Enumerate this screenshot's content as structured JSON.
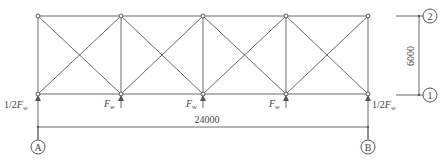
{
  "diagram": {
    "type": "truss-elevation",
    "span_label": "24000",
    "height_label": "6000",
    "bays": 4,
    "axes": {
      "column_left": "A",
      "column_right": "B",
      "level_bottom": "1",
      "level_top": "2"
    },
    "loads": {
      "end_left": {
        "prefix": "1/2",
        "symbol": "F",
        "subscript": "w"
      },
      "interior_1": {
        "prefix": "",
        "symbol": "F",
        "subscript": "w"
      },
      "interior_2": {
        "prefix": "",
        "symbol": "F",
        "subscript": "w"
      },
      "interior_3": {
        "prefix": "",
        "symbol": "F",
        "subscript": "w"
      },
      "end_right": {
        "prefix": "1/2",
        "symbol": "F",
        "subscript": "w"
      }
    },
    "colors": {
      "line": "#6a6a6a",
      "text": "#444444",
      "background": "#ffffff"
    }
  }
}
